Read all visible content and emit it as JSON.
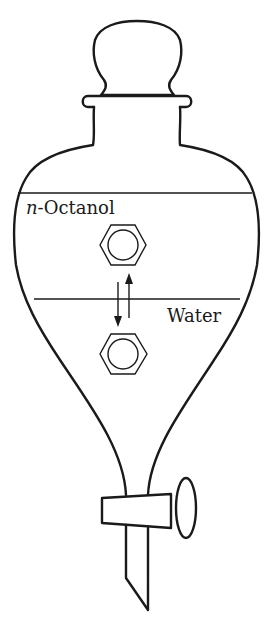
{
  "diagram": {
    "layers": {
      "upper": {
        "prefix": "n",
        "name": "-Octanol"
      },
      "lower": {
        "name": "Water"
      }
    },
    "molecules": [
      {
        "id": "benzene-octanol",
        "label": "benzene ring (octanol phase)"
      },
      {
        "id": "benzene-water",
        "label": "benzene ring (water phase)"
      }
    ],
    "equilibrium": {
      "description": "reversible partition arrows between phases"
    },
    "colors": {
      "stroke": "#1a1a1a",
      "background": "#ffffff"
    }
  }
}
